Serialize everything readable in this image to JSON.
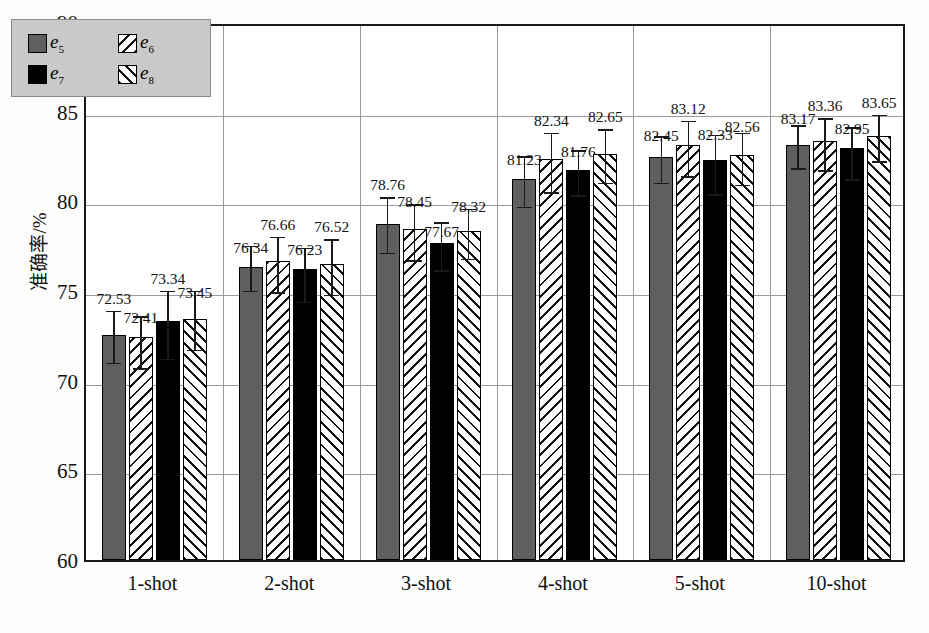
{
  "chart_data": {
    "type": "bar",
    "title": "",
    "xlabel": "",
    "ylabel": "准确率/%",
    "ylim": [
      60,
      90
    ],
    "ytick_labels": [
      "90",
      "85",
      "80",
      "75",
      "70",
      "65",
      "60"
    ],
    "ytick_values": [
      90,
      85,
      80,
      75,
      70,
      65,
      60
    ],
    "grid": true,
    "legend_position": "top-left",
    "categories": [
      "1-shot",
      "2-shot",
      "3-shot",
      "4-shot",
      "5-shot",
      "10-shot"
    ],
    "series": [
      {
        "name": "e5",
        "label": "e",
        "sub": "5",
        "pattern": "solid-gray",
        "color": "#5f5f5f",
        "values": [
          72.53,
          76.34,
          78.76,
          81.23,
          82.45,
          83.17
        ],
        "err_low": [
          1.3,
          1.1,
          1.4,
          1.3,
          1.2,
          1.1
        ],
        "err_high": [
          1.6,
          1.4,
          1.7,
          1.5,
          1.4,
          1.3
        ]
      },
      {
        "name": "e6",
        "label": "e",
        "sub": "6",
        "pattern": "hatch-back",
        "color": "#ffffff",
        "values": [
          72.41,
          76.66,
          78.45,
          82.34,
          83.12,
          83.36
        ],
        "err_low": [
          1.5,
          1.5,
          1.5,
          1.6,
          1.5,
          1.4
        ],
        "err_high": [
          1.4,
          1.6,
          1.6,
          1.7,
          1.6,
          1.5
        ]
      },
      {
        "name": "e7",
        "label": "e",
        "sub": "7",
        "pattern": "solid-black",
        "color": "#000000",
        "values": [
          73.34,
          76.23,
          77.67,
          81.76,
          82.33,
          82.95
        ],
        "err_low": [
          1.9,
          1.6,
          1.3,
          1.2,
          1.7,
          1.5
        ],
        "err_high": [
          1.9,
          1.4,
          1.4,
          1.3,
          1.6,
          1.4
        ]
      },
      {
        "name": "e8",
        "label": "e",
        "sub": "8",
        "pattern": "hatch-fwd",
        "color": "#ffffff",
        "values": [
          73.45,
          76.52,
          78.32,
          82.65,
          82.56,
          83.65
        ],
        "err_low": [
          1.5,
          1.5,
          1.3,
          1.4,
          1.4,
          1.2
        ],
        "err_high": [
          1.8,
          1.6,
          1.5,
          1.6,
          1.5,
          1.4
        ]
      }
    ]
  },
  "axes": {
    "ylabel": "准确率/%",
    "yticks": [
      "90",
      "85",
      "80",
      "75",
      "70",
      "65",
      "60"
    ],
    "xticks": [
      "1-shot",
      "2-shot",
      "3-shot",
      "4-shot",
      "5-shot",
      "10-shot"
    ]
  },
  "legend": {
    "entries": [
      {
        "text": "e",
        "sub": "5",
        "swatch": "solid-gray"
      },
      {
        "text": "e",
        "sub": "6",
        "swatch": "hatch-back"
      },
      {
        "text": "e",
        "sub": "7",
        "swatch": "solid-black"
      },
      {
        "text": "e",
        "sub": "8",
        "swatch": "hatch-fwd"
      }
    ]
  },
  "caption": {
    "text": ""
  }
}
